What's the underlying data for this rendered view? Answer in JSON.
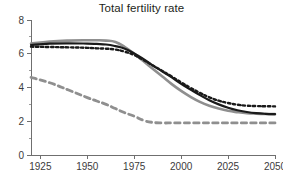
{
  "chart_data": {
    "type": "line",
    "title": "Total fertility rate",
    "xlabel": "",
    "ylabel": "",
    "xlim": [
      1920,
      2050
    ],
    "ylim": [
      0,
      8
    ],
    "xticks": [
      1925,
      1950,
      1975,
      2000,
      2025,
      2050
    ],
    "yticks": [
      0,
      2,
      4,
      6,
      8
    ],
    "xtick_labels": [
      "1925",
      "1950",
      "1975",
      "2000",
      "2025",
      "2050"
    ],
    "ytick_labels": [
      "0",
      "2",
      "4",
      "6",
      "8"
    ],
    "x_minor_ticks": [
      1937.5,
      1962.5,
      1987.5,
      2012.5,
      2037.5
    ],
    "y_minor_ticks": [
      1,
      3,
      5,
      7
    ],
    "grid": false,
    "legend": "none",
    "x": [
      1920,
      1930,
      1940,
      1950,
      1955,
      1960,
      1965,
      1970,
      1975,
      1980,
      1985,
      1990,
      1995,
      2000,
      2005,
      2010,
      2015,
      2020,
      2025,
      2030,
      2035,
      2040,
      2045,
      2050
    ],
    "series": [
      {
        "name": "gray-solid",
        "style": "solid",
        "color": "#8f8f8f",
        "width": 2.6,
        "values": [
          6.6,
          6.72,
          6.78,
          6.8,
          6.8,
          6.78,
          6.7,
          6.4,
          6.0,
          5.55,
          5.1,
          4.65,
          4.2,
          3.8,
          3.45,
          3.15,
          2.92,
          2.75,
          2.62,
          2.54,
          2.48,
          2.45,
          2.43,
          2.42
        ]
      },
      {
        "name": "black-solid",
        "style": "solid",
        "color": "#1a1a1a",
        "width": 2.2,
        "values": [
          6.52,
          6.6,
          6.62,
          6.6,
          6.58,
          6.55,
          6.45,
          6.3,
          6.02,
          5.68,
          5.3,
          4.95,
          4.6,
          4.22,
          3.88,
          3.55,
          3.25,
          3.0,
          2.8,
          2.65,
          2.55,
          2.48,
          2.44,
          2.42
        ]
      },
      {
        "name": "black-dotted",
        "style": "dotted",
        "color": "#1a1a1a",
        "width": 2.4,
        "values": [
          6.42,
          6.4,
          6.38,
          6.35,
          6.32,
          6.3,
          6.25,
          6.12,
          5.92,
          5.62,
          5.3,
          4.98,
          4.65,
          4.3,
          3.98,
          3.68,
          3.42,
          3.22,
          3.08,
          2.98,
          2.92,
          2.9,
          2.89,
          2.88
        ]
      },
      {
        "name": "gray-dashed",
        "style": "dashed",
        "color": "#8f8f8f",
        "width": 2.8,
        "values": [
          4.6,
          4.28,
          3.85,
          3.4,
          3.2,
          3.0,
          2.75,
          2.5,
          2.3,
          2.05,
          1.93,
          1.9,
          1.9,
          1.9,
          1.9,
          1.9,
          1.9,
          1.9,
          1.9,
          1.9,
          1.9,
          1.9,
          1.9,
          1.9
        ]
      }
    ]
  },
  "axis": {
    "left_px": 31,
    "right_px": 275,
    "top_px": 20,
    "bottom_px": 155
  }
}
